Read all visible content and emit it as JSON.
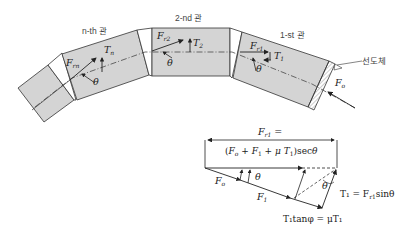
{
  "diagram": {
    "segments": [
      {
        "id": "n-th",
        "label": "n-th 관",
        "force": "F",
        "force_sub": "rn",
        "tension": "T",
        "tension_sub": "n",
        "angle": "θ"
      },
      {
        "id": "2-nd",
        "label": "2-nd 관",
        "force": "F",
        "force_sub": "r2",
        "tension": "T",
        "tension_sub": "2",
        "angle": "θ"
      },
      {
        "id": "1-st",
        "label": "1-st 관",
        "force": "F",
        "force_sub": "r1",
        "tension": "T",
        "tension_sub": "1",
        "angle": "θ"
      }
    ],
    "leading_body_label": "선도체",
    "applied_force": {
      "symbol": "F",
      "sub": "o"
    },
    "vector_diagram": {
      "top_label_line1": "F",
      "top_label_line1_sub": "r1",
      "top_label_line1_suffix": " =",
      "top_label_line2": "(F",
      "top_label_line2_rest": "o + F1 + μT1)secθ",
      "f0_label": "F",
      "f0_sub": "o",
      "f1_label": "F",
      "f1_sub": "1",
      "theta_left": "θ",
      "theta_right": "θ",
      "t1_eq": "T₁ = F",
      "t1_eq_sub": "r1",
      "t1_eq_suffix": "sinθ",
      "friction_eq": "T₁tanφ = μT₁"
    },
    "colors": {
      "segment_fill": "#d4d4d4",
      "stroke": "#333333",
      "text": "#222222"
    }
  }
}
